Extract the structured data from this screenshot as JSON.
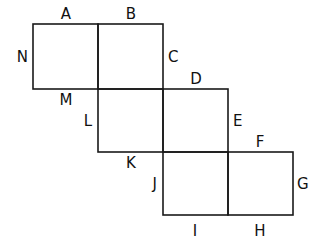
{
  "diagram": {
    "stroke_color": "#1a1a1a",
    "squares": [
      {
        "id": "sq1",
        "col": 0,
        "row": 0
      },
      {
        "id": "sq2",
        "col": 1,
        "row": 0
      },
      {
        "id": "sq3",
        "col": 1,
        "row": 1
      },
      {
        "id": "sq4",
        "col": 2,
        "row": 1
      },
      {
        "id": "sq5",
        "col": 2,
        "row": 2
      },
      {
        "id": "sq6",
        "col": 3,
        "row": 2
      }
    ],
    "labels": {
      "A": "A",
      "B": "B",
      "C": "C",
      "D": "D",
      "E": "E",
      "F": "F",
      "G": "G",
      "H": "H",
      "I": "I",
      "J": "J",
      "K": "K",
      "L": "L",
      "M": "M",
      "N": "N"
    }
  }
}
